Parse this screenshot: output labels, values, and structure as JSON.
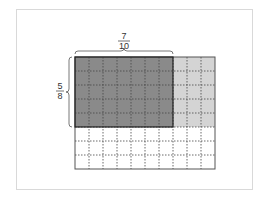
{
  "diagram": {
    "type": "area-model-fraction-multiplication",
    "grid": {
      "columns": 10,
      "rows": 8
    },
    "shaded_columns": 7,
    "shaded_rows": 5,
    "top_label": {
      "numerator": "7",
      "denominator": "10"
    },
    "left_label": {
      "numerator": "5",
      "denominator": "8"
    },
    "colors": {
      "dark_fill": "#8a8a8a",
      "light_fill": "#d4d4d4",
      "empty_fill": "#ffffff",
      "grid_line": "#555555",
      "border": "#444444"
    }
  }
}
